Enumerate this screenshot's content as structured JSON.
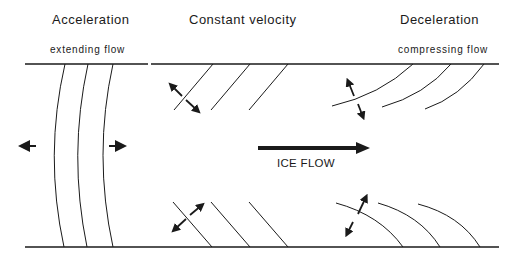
{
  "sections": {
    "acceleration": {
      "title": "Acceleration",
      "subtitle": "extending flow"
    },
    "constant": {
      "title": "Constant velocity"
    },
    "deceleration": {
      "title": "Deceleration",
      "subtitle": "compressing flow"
    }
  },
  "center": {
    "flow_label": "ICE FLOW",
    "flow_direction": "right"
  },
  "colors": {
    "line": "#1a1a1a",
    "background": "#ffffff"
  }
}
